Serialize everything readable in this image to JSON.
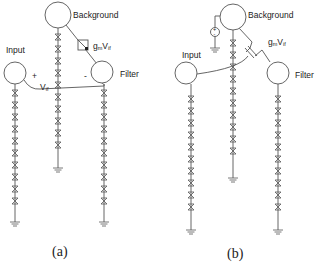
{
  "panels": [
    {
      "id": "a",
      "caption": "(a)",
      "labels": {
        "background": "Background",
        "input": "Input",
        "filter": "Filter",
        "source": "g",
        "source_sub": "m",
        "source_v": "V",
        "source_v_sub": "if",
        "vif": "V",
        "vif_sub": "if",
        "plus": "+",
        "minus": "-"
      }
    },
    {
      "id": "b",
      "caption": "(b)",
      "labels": {
        "background": "Background",
        "input": "Input",
        "filter": "Filter",
        "source": "g",
        "source_sub": "m",
        "source_v": "V",
        "source_v_sub": "if",
        "dc_plus": "+",
        "dc_minus": "-"
      }
    }
  ],
  "colors": {
    "stroke": "#555555",
    "text": "#222222",
    "background": "#ffffff"
  }
}
